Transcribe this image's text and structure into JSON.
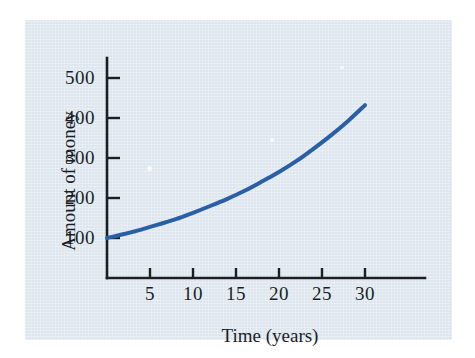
{
  "figure": {
    "background_color": "#ffffff",
    "panel_color": "#dde6ee",
    "axis_color": "#1a1f27",
    "curve_color": "#2a5fa5"
  },
  "chart_data": {
    "type": "line",
    "title": "",
    "subtitle": "",
    "xlabel": "Time (years)",
    "ylabel": "Amount of money",
    "xlim": [
      0,
      34
    ],
    "ylim": [
      0,
      560
    ],
    "xticks": [
      5,
      10,
      15,
      20,
      25,
      30
    ],
    "xtick_labels": [
      "5",
      "10",
      "15",
      "20",
      "25",
      "30"
    ],
    "yticks": [
      100,
      200,
      300,
      400,
      500
    ],
    "ytick_labels": [
      "100",
      "200",
      "300",
      "400",
      "500"
    ],
    "grid": false,
    "legend": null,
    "annotations": [],
    "series": [
      {
        "name": "Amount of money",
        "color": "#2a5fa5",
        "line_width": 4,
        "x": [
          0,
          2,
          4,
          6,
          8,
          10,
          12,
          14,
          16,
          18,
          20,
          22,
          24,
          26,
          28,
          30
        ],
        "y": [
          100,
          110,
          121,
          134,
          147,
          163,
          180,
          198,
          218,
          241,
          265,
          292,
          323,
          356,
          392,
          432
        ]
      }
    ]
  }
}
